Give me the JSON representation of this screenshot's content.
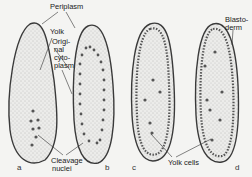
{
  "figure": {
    "panels": [
      {
        "id": "a",
        "label": "a"
      },
      {
        "id": "b",
        "label": "b"
      },
      {
        "id": "c",
        "label": "c"
      },
      {
        "id": "d",
        "label": "d"
      }
    ],
    "labels": {
      "periplasm": "Periplasm",
      "yolk": "Yolk",
      "original_cytoplasm": "Origi-nal cyto-plasm",
      "original_cytoplasm_lines": [
        "Origi-",
        "nal",
        "cyto-",
        "plasm"
      ],
      "cleavage_nuclei_lines": [
        "Cleavage",
        "nuclei"
      ],
      "blastoderm_lines": [
        "Blasto-",
        "derm"
      ],
      "yolk_cells": "Yolk cells"
    },
    "colors": {
      "outline": "#3a3a3a",
      "stipple": "#8a8a8a",
      "background": "#f4f4f2"
    }
  }
}
